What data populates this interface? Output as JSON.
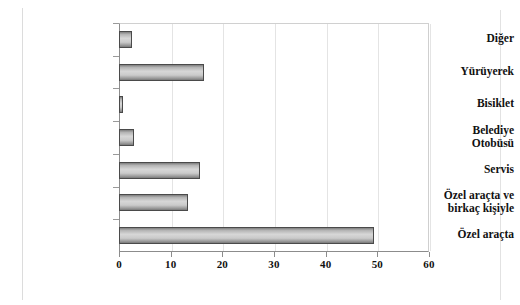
{
  "chart_data": {
    "type": "bar",
    "orientation": "horizontal",
    "title": "",
    "subtitle": "",
    "xlabel": "",
    "ylabel": "",
    "categories": [
      "Özel araçta",
      "Özel araçta ve birkaç kişiyle",
      "Servis",
      "Belediye Otobüsü",
      "Bisiklet",
      "Yürüyerek",
      "Diğer"
    ],
    "category_lines": [
      [
        "Özel araçta"
      ],
      [
        "Özel araçta ve",
        "birkaç kişiyle"
      ],
      [
        "Servis"
      ],
      [
        "Belediye",
        "Otobüsü"
      ],
      [
        "Bisiklet"
      ],
      [
        "Yürüyerek"
      ],
      [
        "Diğer"
      ]
    ],
    "values": [
      49.3,
      13.3,
      15.7,
      2.9,
      0.8,
      16.4,
      2.5
    ],
    "xlim": [
      0,
      60
    ],
    "xticks": [
      0,
      10,
      20,
      30,
      40,
      50,
      60
    ],
    "xtick_labels": [
      "0",
      "10",
      "20",
      "30",
      "40",
      "50",
      "60"
    ],
    "grid": "vertical",
    "legend": "none",
    "series": [
      {
        "name": "",
        "values": [
          49.3,
          13.3,
          15.7,
          2.9,
          0.8,
          16.4,
          2.5
        ]
      }
    ],
    "colors": {
      "bar_fill_light": "#d7d7d7",
      "bar_fill_dark": "#7e7e7e",
      "bar_border": "#4a4a4a",
      "axis": "#8c8c8c",
      "gridline": "#e4e4e4",
      "text": "#111111",
      "background": "#ffffff"
    }
  }
}
